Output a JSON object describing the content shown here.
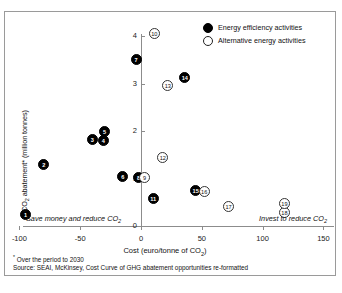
{
  "chart_data": {
    "type": "scatter",
    "title": "",
    "xlabel": "Cost (euro/tonne of CO2)",
    "ylabel": "CO2 abatement* (million tonnes)",
    "xlim": [
      -110,
      155
    ],
    "ylim": [
      0,
      4.3
    ],
    "xticks": [
      -100,
      -50,
      0,
      50,
      100,
      150
    ],
    "yticks": [
      0,
      1,
      2,
      3,
      4
    ],
    "grid": false,
    "legend_position": "top-right",
    "series": [
      {
        "name": "Energy efficiency activities",
        "marker": "filled",
        "points": [
          {
            "label": "1",
            "x": -95,
            "y": 0.25
          },
          {
            "label": "2",
            "x": -80,
            "y": 1.3
          },
          {
            "label": "3",
            "x": -40,
            "y": 1.82
          },
          {
            "label": "4",
            "x": -31,
            "y": 1.8
          },
          {
            "label": "5",
            "x": -30,
            "y": 1.98
          },
          {
            "label": "6",
            "x": -15,
            "y": 1.05
          },
          {
            "label": "7",
            "x": -4,
            "y": 3.5
          },
          {
            "label": "8",
            "x": -2,
            "y": 1.02
          },
          {
            "label": "11",
            "x": 10,
            "y": 0.58
          },
          {
            "label": "14",
            "x": 36,
            "y": 3.12
          },
          {
            "label": "15",
            "x": 45,
            "y": 0.75
          }
        ]
      },
      {
        "name": "Alternative energy activities",
        "marker": "hollow",
        "points": [
          {
            "label": "9",
            "x": 3,
            "y": 1.02
          },
          {
            "label": "10",
            "x": 11,
            "y": 4.05
          },
          {
            "label": "12",
            "x": 18,
            "y": 1.45
          },
          {
            "label": "13",
            "x": 22,
            "y": 2.95
          },
          {
            "label": "16",
            "x": 52,
            "y": 0.73
          },
          {
            "label": "17",
            "x": 72,
            "y": 0.42
          },
          {
            "label": "18",
            "x": 118,
            "y": 0.28
          },
          {
            "label": "19",
            "x": 118,
            "y": 0.48
          }
        ]
      }
    ]
  },
  "legend": {
    "items": [
      {
        "label": "Energy efficiency activities",
        "marker": "filled"
      },
      {
        "label": "Alternative energy activities",
        "marker": "hollow"
      }
    ]
  },
  "annotations": {
    "left": "Save money and reduce CO",
    "left_sub": "2",
    "right": "Invest to reduce CO",
    "right_sub": "2"
  },
  "axis": {
    "x_title_main": "Cost (euro/tonne of CO",
    "x_title_sub": "2",
    "x_title_end": ")",
    "y_title_main": "CO",
    "y_title_sub": "2",
    "y_title_end": " abatement* (million tonnes)"
  },
  "footnotes": {
    "line1_marker": "*",
    "line1": " Over the period to 2030",
    "line2": "Source: SEAI, McKinsey, Cost Curve of GHG abatement opportunities re-formatted"
  }
}
